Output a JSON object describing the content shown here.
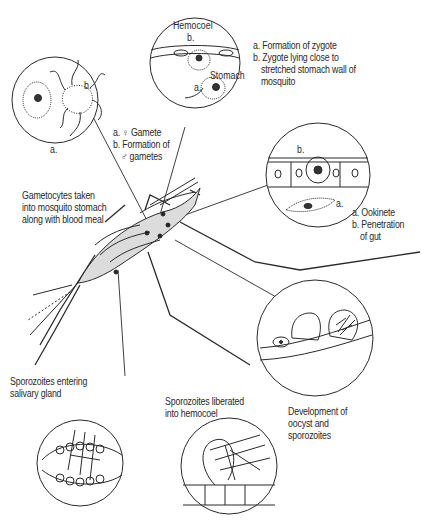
{
  "diagram": {
    "type": "life-cycle illustration",
    "panels": [
      {
        "id": "zygote",
        "inset_labels": {
          "top": "Hemocoel",
          "b": "b.",
          "mid": "Stomach",
          "a": "a."
        },
        "caption_lines": [
          "a. Formation of zygote",
          "b. Zygote lying close to",
          "stretched stomach wall of",
          "mosquito"
        ]
      },
      {
        "id": "gametes",
        "inset_labels": {
          "a": "a.",
          "b": "b."
        },
        "caption_lines": [
          "a. ♀ Gamete",
          "b. Formation of",
          "♂ gametes"
        ]
      },
      {
        "id": "ookinete",
        "inset_labels": {
          "a": "a.",
          "b": "b."
        },
        "caption_lines": [
          "a. Ookinete",
          "b. Penetration",
          "of gut"
        ]
      },
      {
        "id": "gametocytes",
        "caption_lines": [
          "Gametocytes taken",
          "into mosquito stomach",
          "along with blood meal"
        ]
      },
      {
        "id": "oocyst",
        "caption_lines": [
          "Development of",
          "oocyst and",
          "sporozoites"
        ]
      },
      {
        "id": "hemocoel",
        "caption_lines": [
          "Sporozoites liberated",
          "into hemocoel"
        ]
      },
      {
        "id": "salivary",
        "caption_lines": [
          "Sporozoites entering",
          "salivary gland"
        ]
      }
    ],
    "colors": {
      "ink": "#2a2a2a",
      "background": "#ffffff",
      "shade": "#d9d9d9"
    }
  }
}
